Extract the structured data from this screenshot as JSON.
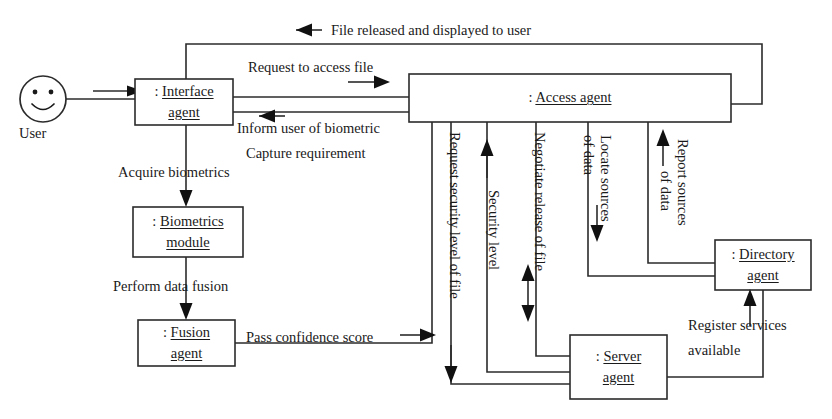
{
  "diagram": {
    "colors": {
      "line": "#2b2b2b",
      "text": "#1a1a1a",
      "background": "#ffffff"
    },
    "actors": [
      {
        "id": "user",
        "caption": "User",
        "icon": "smiley-face-icon"
      }
    ],
    "nodes": [
      {
        "id": "interface-agent",
        "prefix": ": ",
        "line1": "Interface",
        "line2": "agent"
      },
      {
        "id": "access-agent",
        "prefix": ": ",
        "line1": "Access agent",
        "line2": ""
      },
      {
        "id": "biometrics-module",
        "prefix": ": ",
        "line1": "Biometrics",
        "line2": "module"
      },
      {
        "id": "fusion-agent",
        "prefix": ": ",
        "line1": "Fusion",
        "line2": "agent"
      },
      {
        "id": "server-agent",
        "prefix": ": ",
        "line1": "Server",
        "line2": "agent"
      },
      {
        "id": "directory-agent",
        "prefix": ": ",
        "line1": "Directory",
        "line2": "agent"
      }
    ],
    "messages": [
      {
        "id": "file-released",
        "text": "File released and displayed to user",
        "orientation": "horizontal",
        "direction": "left"
      },
      {
        "id": "request-access-file",
        "text": "Request to access file",
        "orientation": "horizontal",
        "direction": "right"
      },
      {
        "id": "inform-user-line1",
        "text": "Inform user of biometric",
        "orientation": "horizontal",
        "direction": "left"
      },
      {
        "id": "inform-user-line2",
        "text": "Capture requirement",
        "orientation": "horizontal",
        "direction": "left"
      },
      {
        "id": "acquire-biometrics",
        "text": "Acquire biometrics",
        "orientation": "horizontal",
        "direction": "down"
      },
      {
        "id": "perform-data-fusion",
        "text": "Perform data fusion",
        "orientation": "horizontal",
        "direction": "down"
      },
      {
        "id": "pass-confidence",
        "text": "Pass confidence score",
        "orientation": "horizontal",
        "direction": "right"
      },
      {
        "id": "request-security",
        "text": "Request security level of file",
        "orientation": "vertical",
        "direction": "down"
      },
      {
        "id": "security-level",
        "text": "Security level",
        "orientation": "vertical",
        "direction": "up"
      },
      {
        "id": "negotiate-release",
        "text": "Negotiate release of file",
        "orientation": "vertical",
        "direction": "both"
      },
      {
        "id": "locate-sources",
        "text": "Locate sources",
        "text2": "of data",
        "orientation": "vertical",
        "direction": "down"
      },
      {
        "id": "report-sources",
        "text": "Report sources",
        "text2": "of data",
        "orientation": "vertical",
        "direction": "up"
      },
      {
        "id": "register-services-l1",
        "text": "Register services",
        "orientation": "horizontal",
        "direction": "up"
      },
      {
        "id": "register-services-l2",
        "text": "available",
        "orientation": "horizontal",
        "direction": "up"
      }
    ]
  }
}
